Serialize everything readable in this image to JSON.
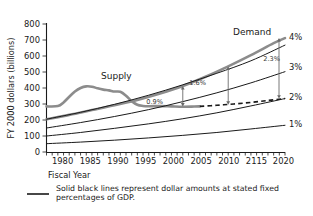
{
  "chart_data": {
    "type": "line",
    "title": "",
    "xlabel": "Fiscal Year",
    "ylabel": "FY 2000 dollars (billions)",
    "xlim": [
      1978,
      2020
    ],
    "ylim": [
      0,
      800
    ],
    "ytick_labels": [
      "0",
      "100",
      "200",
      "300",
      "400",
      "500",
      "600",
      "700",
      "800"
    ],
    "ytick_values": [
      0,
      100,
      200,
      300,
      400,
      500,
      600,
      700,
      800
    ],
    "xtick_labels": [
      "1980",
      "1985",
      "1990",
      "1995",
      "2000",
      "2005",
      "2010",
      "2115",
      "2020"
    ],
    "xtick_values": [
      1980,
      1985,
      1990,
      1995,
      2000,
      2005,
      2010,
      2015,
      2020
    ],
    "minor_xticks_every": 1,
    "grid": false,
    "legend_position": "inline-labels",
    "series": [
      {
        "name": "Supply",
        "style": "solid-gray-thick",
        "color": "#8c8c8c",
        "label_text": "Supply",
        "x": [
          1978,
          1980,
          1981,
          1982,
          1983,
          1984,
          1985,
          1986,
          1987,
          1988,
          1989,
          1990,
          1991,
          1992,
          1993,
          1994,
          1995,
          1996,
          1998,
          2000,
          2002,
          2004,
          2005
        ],
        "values": [
          285,
          287,
          310,
          345,
          378,
          400,
          410,
          408,
          398,
          390,
          385,
          378,
          376,
          352,
          318,
          295,
          288,
          286,
          287,
          285,
          283,
          284,
          285
        ]
      },
      {
        "name": "Demand",
        "style": "solid-gray-thick",
        "color": "#8c8c8c",
        "label_text": "Demand",
        "x": [
          1978,
          1982,
          1986,
          1990,
          1994,
          1998,
          2002,
          2006,
          2010,
          2014,
          2018,
          2020
        ],
        "values": [
          205,
          232,
          262,
          292,
          325,
          365,
          412,
          470,
          535,
          605,
          680,
          712
        ]
      },
      {
        "name": "4% of GDP",
        "style": "solid-black",
        "color": "#1a1a1a",
        "label_text": "4%",
        "x": [
          1978,
          1984,
          1990,
          1996,
          2002,
          2008,
          2014,
          2020
        ],
        "values": [
          205,
          248,
          298,
          355,
          420,
          492,
          570,
          668
        ]
      },
      {
        "name": "3% of GDP",
        "style": "solid-black",
        "color": "#1a1a1a",
        "label_text": "3%",
        "x": [
          1978,
          1984,
          1990,
          1996,
          2002,
          2008,
          2014,
          2020
        ],
        "values": [
          150,
          184,
          222,
          265,
          315,
          370,
          432,
          502
        ]
      },
      {
        "name": "2% of GDP",
        "style": "solid-black",
        "color": "#1a1a1a",
        "label_text": "2%",
        "x": [
          1978,
          1984,
          1990,
          1996,
          2002,
          2008,
          2014,
          2020
        ],
        "values": [
          100,
          122,
          148,
          176,
          208,
          245,
          288,
          334
        ]
      },
      {
        "name": "1% of GDP",
        "style": "solid-black",
        "color": "#1a1a1a",
        "label_text": "1%",
        "x": [
          1978,
          1984,
          1990,
          1996,
          2002,
          2008,
          2014,
          2020
        ],
        "values": [
          52,
          62,
          74,
          88,
          104,
          122,
          144,
          167
        ]
      },
      {
        "name": "Extended supply (flat)",
        "style": "dashed-black",
        "color": "#1a1a1a",
        "label_text": "",
        "x": [
          2005,
          2008,
          2011,
          2014,
          2017,
          2020
        ],
        "values": [
          285,
          292,
          300,
          310,
          322,
          334
        ]
      }
    ],
    "annotations": [
      {
        "text": "0.9%",
        "at_year": 2002,
        "from_value": 285,
        "to_value": 412,
        "note": "gap between extended supply and demand"
      },
      {
        "text": "1.6%",
        "at_year": 2010,
        "from_value": 296,
        "to_value": 535,
        "note": "gap between extended supply and demand"
      },
      {
        "text": "2.3%",
        "at_year": 2020,
        "from_value": 334,
        "to_value": 712,
        "note": "gap between extended supply and demand"
      }
    ],
    "right_axis_labels": [
      "4%",
      "3%",
      "2%",
      "1%"
    ]
  },
  "footnote": {
    "swatch_name": "solid-line-swatch",
    "text": "Solid black lines represent dollar amounts at stated fixed percentages of GDP."
  }
}
